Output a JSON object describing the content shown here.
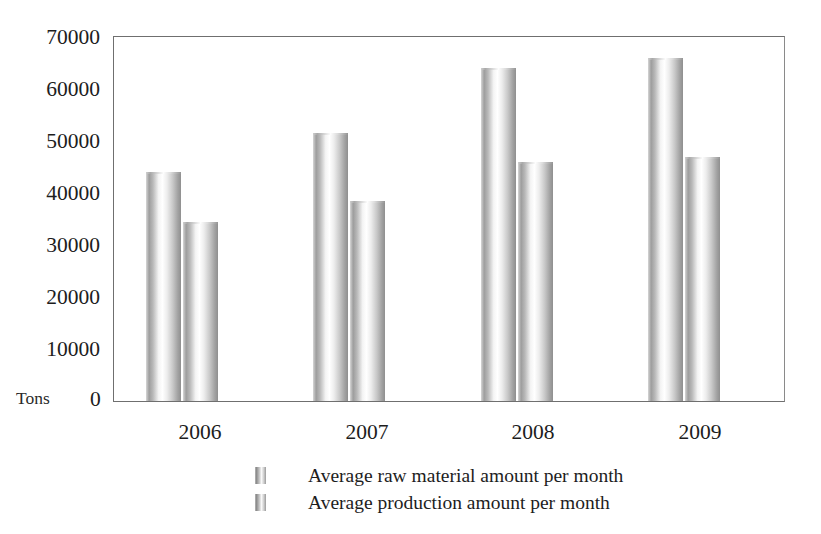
{
  "chart_data": {
    "type": "bar",
    "title": "",
    "subtitle": "",
    "xlabel": "",
    "ylabel": "Tons",
    "categories": [
      "2006",
      "2007",
      "2008",
      "2009"
    ],
    "series": [
      {
        "name": "Average raw material amount per month",
        "values": [
          44000,
          51500,
          64000,
          66000
        ]
      },
      {
        "name": "Average production amount per month",
        "values": [
          34500,
          38500,
          46000,
          47000
        ]
      }
    ],
    "ylim": [
      0,
      70000
    ],
    "y_ticks": [
      0,
      10000,
      20000,
      30000,
      40000,
      50000,
      60000,
      70000
    ],
    "y_tick_labels": [
      "0",
      "10000",
      "20000",
      "30000",
      "40000",
      "50000",
      "60000",
      "70000"
    ],
    "grid": false,
    "legend_position": "bottom",
    "bar_style": "cylinder-gradient-grayscale",
    "colors": {
      "bar_light": "#ffffff",
      "bar_mid": "#c9c9c9",
      "bar_dark": "#8f8f8f",
      "axis": "#6f6f6f",
      "text": "#1d1d1d"
    }
  },
  "axis": {
    "y_label": "Tons",
    "zero_label": "0",
    "y_tick_labels": [
      "70000",
      "60000",
      "50000",
      "40000",
      "30000",
      "20000",
      "10000"
    ]
  },
  "legend": {
    "items": [
      {
        "label": "Average raw material amount per month",
        "swatch": "bar-swatch-series-1"
      },
      {
        "label": "Average production amount per month",
        "swatch": "bar-swatch-series-2"
      }
    ]
  }
}
